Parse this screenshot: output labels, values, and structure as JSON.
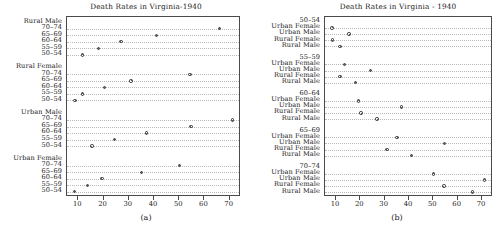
{
  "figure": {
    "panels": [
      {
        "key": "a",
        "caption": "(a)",
        "title": "Death Rates in Virginia-1940",
        "grouping": "by-demographic",
        "axis": {
          "ticks": [
            10,
            20,
            30,
            40,
            50,
            60,
            70
          ],
          "tick_labels": [
            "10",
            "20",
            "30",
            "40",
            "50",
            "60",
            "70"
          ],
          "min": 5.5,
          "max": 74.5
        },
        "groups": [
          {
            "label": "Rural Male",
            "rows": [
              {
                "label": "70–74",
                "value": 66.0
              },
              {
                "label": "65–69",
                "value": 41.0
              },
              {
                "label": "60–64",
                "value": 26.9
              },
              {
                "label": "55–59",
                "value": 18.1
              },
              {
                "label": "50–54",
                "value": 11.7
              }
            ]
          },
          {
            "label": "Rural Female",
            "rows": [
              {
                "label": "70–74",
                "value": 54.3
              },
              {
                "label": "65–69",
                "value": 30.9
              },
              {
                "label": "60–64",
                "value": 20.3
              },
              {
                "label": "55–59",
                "value": 11.7
              },
              {
                "label": "50–54",
                "value": 8.7
              }
            ]
          },
          {
            "label": "Urban Male",
            "rows": [
              {
                "label": "70–74",
                "value": 71.1
              },
              {
                "label": "65–69",
                "value": 54.6
              },
              {
                "label": "60–64",
                "value": 37.0
              },
              {
                "label": "55–59",
                "value": 24.3
              },
              {
                "label": "50–54",
                "value": 15.4
              }
            ]
          },
          {
            "label": "Urban Female",
            "rows": [
              {
                "label": "70–74",
                "value": 50.0
              },
              {
                "label": "65–69",
                "value": 35.1
              },
              {
                "label": "60–64",
                "value": 19.3
              },
              {
                "label": "55–59",
                "value": 13.6
              },
              {
                "label": "50–54",
                "value": 8.4
              }
            ]
          }
        ]
      },
      {
        "key": "b",
        "caption": "(b)",
        "title": "Death Rates in Virginia - 1940",
        "grouping": "by-age",
        "axis": {
          "ticks": [
            10,
            20,
            30,
            40,
            50,
            60,
            70
          ],
          "tick_labels": [
            "10",
            "20",
            "30",
            "40",
            "50",
            "60",
            "70"
          ],
          "min": 5.5,
          "max": 74.5
        },
        "groups": [
          {
            "label": "50–54",
            "rows": [
              {
                "label": "Urban Female",
                "value": 8.4
              },
              {
                "label": "Urban Male",
                "value": 15.4
              },
              {
                "label": "Rural Female",
                "value": 8.7
              },
              {
                "label": "Rural Male",
                "value": 11.7
              }
            ]
          },
          {
            "label": "55–59",
            "rows": [
              {
                "label": "Urban Female",
                "value": 13.6
              },
              {
                "label": "Urban Male",
                "value": 24.3
              },
              {
                "label": "Rural Female",
                "value": 11.7
              },
              {
                "label": "Rural Male",
                "value": 18.1
              }
            ]
          },
          {
            "label": "60–64",
            "rows": [
              {
                "label": "Urban Female",
                "value": 19.3
              },
              {
                "label": "Urban Male",
                "value": 37.0
              },
              {
                "label": "Rural Female",
                "value": 20.3
              },
              {
                "label": "Rural Male",
                "value": 26.9
              }
            ]
          },
          {
            "label": "65–69",
            "rows": [
              {
                "label": "Urban Female",
                "value": 35.1
              },
              {
                "label": "Urban Male",
                "value": 54.6
              },
              {
                "label": "Rural Female",
                "value": 30.9
              },
              {
                "label": "Rural Male",
                "value": 41.0
              }
            ]
          },
          {
            "label": "70–74",
            "rows": [
              {
                "label": "Urban Female",
                "value": 50.0
              },
              {
                "label": "Urban Male",
                "value": 71.1
              },
              {
                "label": "Rural Female",
                "value": 54.3
              },
              {
                "label": "Rural Male",
                "value": 66.0
              }
            ]
          }
        ]
      }
    ]
  },
  "chart_data": [
    {
      "type": "scatter",
      "subtype": "dot-plot",
      "panel": "(a)",
      "title": "Death Rates in Virginia-1940",
      "xlabel": "",
      "ylabel": "",
      "xlim": [
        5.5,
        74.5
      ],
      "xticks": [
        10,
        20,
        30,
        40,
        50,
        60,
        70
      ],
      "grid": "dotted-horizontal",
      "legend": "none",
      "categories": [
        "Rural Male 70–74",
        "Rural Male 65–69",
        "Rural Male 60–64",
        "Rural Male 55–59",
        "Rural Male 50–54",
        "Rural Female 70–74",
        "Rural Female 65–69",
        "Rural Female 60–64",
        "Rural Female 55–59",
        "Rural Female 50–54",
        "Urban Male 70–74",
        "Urban Male 65–69",
        "Urban Male 60–64",
        "Urban Male 55–59",
        "Urban Male 50–54",
        "Urban Female 70–74",
        "Urban Female 65–69",
        "Urban Female 60–64",
        "Urban Female 55–59",
        "Urban Female 50–54"
      ],
      "values": [
        66.0,
        41.0,
        26.9,
        18.1,
        11.7,
        54.3,
        30.9,
        20.3,
        11.7,
        8.7,
        71.1,
        54.6,
        37.0,
        24.3,
        15.4,
        50.0,
        35.1,
        19.3,
        13.6,
        8.4
      ]
    },
    {
      "type": "scatter",
      "subtype": "dot-plot",
      "panel": "(b)",
      "title": "Death Rates in Virginia - 1940",
      "xlabel": "",
      "ylabel": "",
      "xlim": [
        5.5,
        74.5
      ],
      "xticks": [
        10,
        20,
        30,
        40,
        50,
        60,
        70
      ],
      "grid": "dotted-horizontal",
      "legend": "none",
      "categories": [
        "50–54 Urban Female",
        "50–54 Urban Male",
        "50–54 Rural Female",
        "50–54 Rural Male",
        "55–59 Urban Female",
        "55–59 Urban Male",
        "55–59 Rural Female",
        "55–59 Rural Male",
        "60–64 Urban Female",
        "60–64 Urban Male",
        "60–64 Rural Female",
        "60–64 Rural Male",
        "65–69 Urban Female",
        "65–69 Urban Male",
        "65–69 Rural Female",
        "65–69 Rural Male",
        "70–74 Urban Female",
        "70–74 Urban Male",
        "70–74 Rural Female",
        "70–74 Rural Male"
      ],
      "values": [
        8.4,
        15.4,
        8.7,
        11.7,
        13.6,
        24.3,
        11.7,
        18.1,
        19.3,
        37.0,
        20.3,
        26.9,
        35.1,
        54.6,
        30.9,
        41.0,
        50.0,
        71.1,
        54.3,
        66.0
      ]
    }
  ]
}
